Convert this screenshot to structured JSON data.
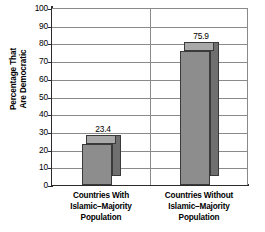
{
  "chart_data": {
    "type": "bar",
    "title": "",
    "subtitle": "",
    "xlabel": "",
    "ylabel_line1": "Percentage That",
    "ylabel_line2": "Are Democratic",
    "categories": [
      "Countries With Islamic–Majority Population",
      "Countries Without Islamic–Majority Population"
    ],
    "category_lines": [
      [
        "Countries With",
        "Islamic–Majority",
        "Population"
      ],
      [
        "Countries Without",
        "Islamic–Majority",
        "Population"
      ]
    ],
    "values": [
      23.4,
      75.9
    ],
    "value_labels": [
      "23.4",
      "75.9"
    ],
    "ylim": [
      0,
      100
    ],
    "ytick_step": 10,
    "ytick_labels": [
      "100",
      "90",
      "80",
      "70",
      "60",
      "50",
      "40",
      "30",
      "20",
      "10",
      "0"
    ],
    "ytick_values": [
      100,
      90,
      80,
      70,
      60,
      50,
      40,
      30,
      20,
      10,
      0
    ],
    "grid": true,
    "legend": "none",
    "style": "3d-column",
    "colors": {
      "bar_front": "#8d8d8d",
      "bar_side": "#6f6f6f",
      "bar_top": "#a9a9a9",
      "bar_edge": "#3a3a3a",
      "gridline": "#8a8a8a",
      "axis": "#2b2b2b",
      "text": "#000000",
      "background": "#ffffff"
    }
  }
}
